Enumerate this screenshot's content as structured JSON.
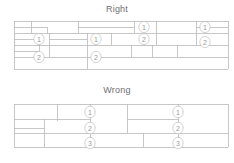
{
  "figure": {
    "type": "technical-diagram",
    "background_color": "#ffffff",
    "line_color": "#b9b9b9",
    "text_color": "#6f6f6f",
    "marker_text_color": "#9a9a9a",
    "width": 234,
    "height": 163
  },
  "panels": [
    {
      "id": "right",
      "title": "Right",
      "title_x": 117,
      "title_y": 4,
      "description": "Staggered head joints across courses",
      "origin_y": 18,
      "courses": [
        {
          "y_top": 21,
          "y_bottom": 33,
          "joints_x": [
            23,
            47,
            78,
            110,
            134,
            156,
            196
          ]
        },
        {
          "y_top": 33,
          "y_bottom": 45,
          "joints_x": [
            14,
            63,
            87,
            111,
            142,
            176,
            208
          ]
        },
        {
          "y_top": 45,
          "y_bottom": 57,
          "joints_x": [
            33,
            58,
            82,
            106,
            131,
            163,
            191
          ]
        },
        {
          "y_top": 57,
          "y_bottom": 69,
          "joints_x": [
            18,
            49,
            70,
            101,
            125,
            148,
            180
          ]
        }
      ],
      "markers": [
        {
          "label": "1",
          "x": 39,
          "y": 39
        },
        {
          "label": "2",
          "x": 39,
          "y": 57
        },
        {
          "label": "1",
          "x": 96,
          "y": 39
        },
        {
          "label": "2",
          "x": 96,
          "y": 57
        },
        {
          "label": "1",
          "x": 144,
          "y": 27
        },
        {
          "label": "2",
          "x": 144,
          "y": 39
        },
        {
          "label": "1",
          "x": 205,
          "y": 27
        },
        {
          "label": "2",
          "x": 205,
          "y": 42
        }
      ]
    },
    {
      "id": "wrong",
      "title": "Wrong",
      "title_x": 117,
      "title_y": 88,
      "description": "Head joints stacked vertically through three courses",
      "origin_y": 102,
      "courses": [
        {
          "y_top": 104,
          "y_bottom": 119,
          "joints_x": [
            57,
            90,
            127,
            178
          ]
        },
        {
          "y_top": 119,
          "y_bottom": 133,
          "joints_x": [
            44,
            90,
            127,
            178
          ]
        },
        {
          "y_top": 133,
          "y_bottom": 147,
          "joints_x": [
            44,
            90,
            143,
            178
          ]
        },
        {
          "y_top": 147,
          "y_bottom": 157,
          "joints_x": [
            44,
            90,
            143,
            178
          ]
        }
      ],
      "markers": [
        {
          "label": "1",
          "x": 90,
          "y": 112
        },
        {
          "label": "2",
          "x": 90,
          "y": 128
        },
        {
          "label": "3",
          "x": 90,
          "y": 143
        },
        {
          "label": "1",
          "x": 178,
          "y": 112
        },
        {
          "label": "2",
          "x": 178,
          "y": 128
        },
        {
          "label": "3",
          "x": 178,
          "y": 143
        }
      ]
    }
  ],
  "right_geometry": {
    "horizontals": [
      {
        "x1": 14,
        "y": 21,
        "x2": 228
      },
      {
        "x1": 14,
        "y": 27,
        "x2": 47
      },
      {
        "x1": 78,
        "y": 27,
        "x2": 134
      },
      {
        "x1": 196,
        "y": 27,
        "x2": 228
      },
      {
        "x1": 14,
        "y": 33,
        "x2": 228
      },
      {
        "x1": 14,
        "y": 45,
        "x2": 228
      },
      {
        "x1": 14,
        "y": 57,
        "x2": 228
      },
      {
        "x1": 14,
        "y": 69,
        "x2": 228
      }
    ],
    "verticals": [
      {
        "x": 31,
        "y1": 21,
        "y2": 33
      },
      {
        "x": 78,
        "y1": 21,
        "y2": 33
      },
      {
        "x": 134,
        "y1": 21,
        "y2": 33
      },
      {
        "x": 156,
        "y1": 21,
        "y2": 33
      },
      {
        "x": 196,
        "y1": 21,
        "y2": 33
      },
      {
        "x": 47,
        "y1": 27,
        "y2": 33
      },
      {
        "x": 39,
        "y1": 33,
        "y2": 45
      },
      {
        "x": 49,
        "y1": 33,
        "y2": 45
      },
      {
        "x": 87,
        "y1": 33,
        "y2": 45
      },
      {
        "x": 111,
        "y1": 33,
        "y2": 45
      },
      {
        "x": 156,
        "y1": 33,
        "y2": 45
      },
      {
        "x": 196,
        "y1": 33,
        "y2": 45
      },
      {
        "x": 14,
        "y1": 39,
        "y2": 45
      },
      {
        "x": 39,
        "y1": 45,
        "y2": 57
      },
      {
        "x": 49,
        "y1": 45,
        "y2": 57
      },
      {
        "x": 87,
        "y1": 45,
        "y2": 57
      },
      {
        "x": 131,
        "y1": 45,
        "y2": 57
      },
      {
        "x": 152,
        "y1": 45,
        "y2": 57
      },
      {
        "x": 177,
        "y1": 45,
        "y2": 57
      },
      {
        "x": 14,
        "y1": 45,
        "y2": 69
      },
      {
        "x": 87,
        "y1": 57,
        "y2": 69
      },
      {
        "x": 228,
        "y1": 21,
        "y2": 69
      }
    ]
  },
  "wrong_geometry": {
    "horizontals": [
      {
        "x1": 14,
        "y": 104,
        "x2": 228
      },
      {
        "x1": 14,
        "y": 119,
        "x2": 90
      },
      {
        "x1": 127,
        "y": 119,
        "x2": 178
      },
      {
        "x1": 14,
        "y": 128,
        "x2": 44
      },
      {
        "x1": 90,
        "y": 133,
        "x2": 228
      },
      {
        "x1": 14,
        "y": 133,
        "x2": 90
      },
      {
        "x1": 14,
        "y": 147,
        "x2": 228
      }
    ],
    "verticals": [
      {
        "x": 57,
        "y1": 104,
        "y2": 121
      },
      {
        "x": 90,
        "y1": 104,
        "y2": 147
      },
      {
        "x": 127,
        "y1": 104,
        "y2": 133
      },
      {
        "x": 178,
        "y1": 104,
        "y2": 147
      },
      {
        "x": 44,
        "y1": 119,
        "y2": 147
      },
      {
        "x": 143,
        "y1": 133,
        "y2": 147
      },
      {
        "x": 14,
        "y1": 104,
        "y2": 147
      },
      {
        "x": 228,
        "y1": 104,
        "y2": 147
      }
    ]
  }
}
